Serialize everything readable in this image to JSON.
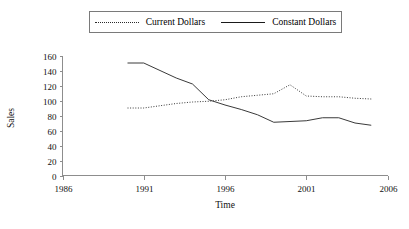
{
  "legend": {
    "entries": [
      {
        "label": "Current Dollars",
        "style": "dotted"
      },
      {
        "label": "Constant Dollars",
        "style": "solid"
      }
    ]
  },
  "axes": {
    "y_title": "Sales",
    "x_title": "Time",
    "y_ticks": [
      "0",
      "20",
      "40",
      "60",
      "80",
      "100",
      "120",
      "140",
      "160"
    ],
    "x_ticks": [
      "1986",
      "1991",
      "1996",
      "2001",
      "2006"
    ]
  },
  "chart_data": {
    "type": "line",
    "title": "",
    "xlabel": "Time",
    "ylabel": "Sales",
    "xlim": [
      1986,
      2006
    ],
    "ylim": [
      0,
      160
    ],
    "grid": false,
    "legend_position": "top-center",
    "xticks": [
      1986,
      1991,
      1996,
      2001,
      2006
    ],
    "yticks": [
      0,
      20,
      40,
      60,
      80,
      100,
      120,
      140,
      160
    ],
    "series": [
      {
        "name": "Current Dollars",
        "style": "dotted",
        "color": "#3a3a3a",
        "x": [
          1990,
          1991,
          1992,
          1993,
          1994,
          1995,
          1996,
          1997,
          1998,
          1999,
          2000,
          2001,
          2002,
          2003,
          2004,
          2005
        ],
        "values": [
          90,
          90,
          93,
          96,
          98,
          99,
          101,
          105,
          107,
          109,
          121,
          106,
          105,
          105,
          103,
          102
        ]
      },
      {
        "name": "Constant Dollars",
        "style": "solid",
        "color": "#3a3a3a",
        "x": [
          1990,
          1991,
          1992,
          1993,
          1994,
          1995,
          1996,
          1997,
          1998,
          1999,
          2000,
          2001,
          2002,
          2003,
          2004,
          2005
        ],
        "values": [
          150,
          150,
          140,
          130,
          122,
          101,
          94,
          88,
          81,
          71,
          72,
          73,
          77,
          77,
          70,
          67
        ]
      }
    ]
  }
}
